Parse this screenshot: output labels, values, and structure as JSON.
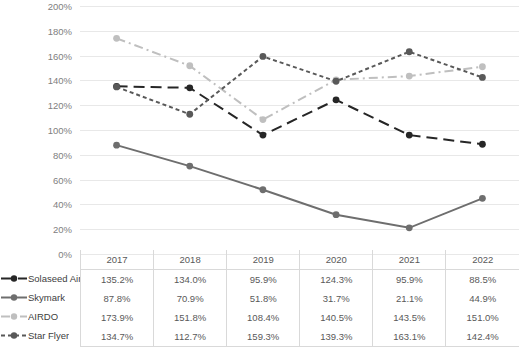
{
  "top_caption": "",
  "chart_data": {
    "type": "line",
    "title": "",
    "xlabel": "",
    "ylabel": "",
    "categories": [
      "2017",
      "2018",
      "2019",
      "2020",
      "2021",
      "2022"
    ],
    "ylim": [
      0,
      200
    ],
    "ytick_step": 20,
    "ytick_labels": [
      "200%",
      "180%",
      "160%",
      "140%",
      "120%",
      "100%",
      "80%",
      "60%",
      "40%",
      "20%",
      "0%"
    ],
    "grid": true,
    "legend_position": "left-of-table",
    "value_suffix": "%",
    "series": [
      {
        "name": "Solaseed Air",
        "color": "#262626",
        "line_style": "long-dash",
        "marker": "circle",
        "values": [
          135.2,
          134.0,
          95.9,
          124.3,
          95.9,
          88.5
        ],
        "labels": [
          "135.2%",
          "134.0%",
          "95.9%",
          "124.3%",
          "95.9%",
          "88.5%"
        ]
      },
      {
        "name": "Skymark",
        "color": "#6e6e6e",
        "line_style": "solid",
        "marker": "circle",
        "values": [
          87.8,
          70.9,
          51.8,
          31.7,
          21.1,
          44.9
        ],
        "labels": [
          "87.8%",
          "70.9%",
          "51.8%",
          "31.7%",
          "21.1%",
          "44.9%"
        ]
      },
      {
        "name": "AIRDO",
        "color": "#bfbfbf",
        "line_style": "dash-dot",
        "marker": "circle",
        "values": [
          173.9,
          151.8,
          108.4,
          140.5,
          143.5,
          151.0
        ],
        "labels": [
          "173.9%",
          "151.8%",
          "108.4%",
          "140.5%",
          "143.5%",
          "151.0%"
        ]
      },
      {
        "name": "Star Flyer",
        "color": "#595959",
        "line_style": "short-dash",
        "marker": "circle",
        "values": [
          134.7,
          112.7,
          159.3,
          139.3,
          163.1,
          142.4
        ],
        "labels": [
          "134.7%",
          "112.7%",
          "159.3%",
          "139.3%",
          "163.1%",
          "142.4%"
        ]
      }
    ]
  },
  "table": {
    "corner_label": "",
    "columns": [
      "2017",
      "2018",
      "2019",
      "2020",
      "2021",
      "2022"
    ],
    "rows": [
      {
        "label": "Solaseed Air",
        "cells": [
          "135.2%",
          "134.0%",
          "95.9%",
          "124.3%",
          "95.9%",
          "88.5%"
        ]
      },
      {
        "label": "Skymark",
        "cells": [
          "87.8%",
          "70.9%",
          "51.8%",
          "31.7%",
          "21.1%",
          "44.9%"
        ]
      },
      {
        "label": "AIRDO",
        "cells": [
          "173.9%",
          "151.8%",
          "108.4%",
          "140.5%",
          "143.5%",
          "151.0%"
        ]
      },
      {
        "label": "Star Flyer",
        "cells": [
          "134.7%",
          "112.7%",
          "159.3%",
          "139.3%",
          "163.1%",
          "142.4%"
        ]
      }
    ]
  }
}
